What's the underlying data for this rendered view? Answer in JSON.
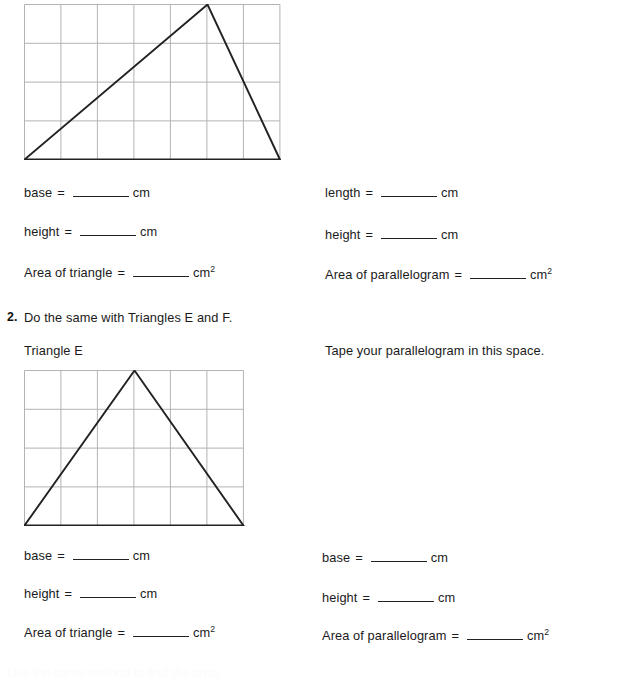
{
  "page": {
    "width": 617,
    "height": 674,
    "background": "#ffffff",
    "ink_color": "#1a1a1a",
    "grid_line_color": "#b3b3b3",
    "shape_line_color": "#222222"
  },
  "question1": {
    "figure": {
      "name": "Triangle with grid (Triangle C/D)",
      "grid_columns": 7,
      "grid_rows": 4,
      "triangle_vertices_cells": [
        [
          0,
          4
        ],
        [
          5,
          0
        ],
        [
          7,
          4
        ]
      ]
    },
    "left_column": {
      "rows": [
        {
          "label": "base",
          "equals": "=",
          "blank": "",
          "unit": "cm",
          "exponent": ""
        },
        {
          "label": "height",
          "equals": "=",
          "blank": "",
          "unit": "cm",
          "exponent": ""
        },
        {
          "label": "Area of triangle",
          "equals": "=",
          "blank": "",
          "unit": "cm",
          "exponent": "2"
        }
      ]
    },
    "right_column": {
      "rows": [
        {
          "label": "length",
          "equals": "=",
          "blank": "",
          "unit": "cm",
          "exponent": ""
        },
        {
          "label": "height",
          "equals": "=",
          "blank": "",
          "unit": "cm",
          "exponent": ""
        },
        {
          "label": "Area of parallelogram",
          "equals": "=",
          "blank": "",
          "unit": "cm",
          "exponent": "2"
        }
      ]
    }
  },
  "question2": {
    "number": "2.",
    "prompt": "Do the same with Triangles E and F.",
    "left_caption": "Triangle E",
    "right_caption": "Tape your parallelogram in this space.",
    "figure": {
      "name": "Isosceles triangle with grid (Triangle E)",
      "grid_columns": 6,
      "grid_rows": 4,
      "triangle_vertices_cells": [
        [
          0,
          4
        ],
        [
          3,
          0
        ],
        [
          6,
          4
        ]
      ]
    },
    "left_column": {
      "rows": [
        {
          "label": "base",
          "equals": "=",
          "blank": "",
          "unit": "cm",
          "exponent": ""
        },
        {
          "label": "height",
          "equals": "=",
          "blank": "",
          "unit": "cm",
          "exponent": ""
        },
        {
          "label": "Area of triangle",
          "equals": "=",
          "blank": "",
          "unit": "cm",
          "exponent": "2"
        }
      ]
    },
    "right_column": {
      "rows": [
        {
          "label": "base",
          "equals": "=",
          "blank": "",
          "unit": "cm",
          "exponent": ""
        },
        {
          "label": "height",
          "equals": "=",
          "blank": "",
          "unit": "cm",
          "exponent": ""
        },
        {
          "label": "Area of parallelogram",
          "equals": "=",
          "blank": "",
          "unit": "cm",
          "exponent": "2"
        }
      ]
    }
  },
  "footer": {
    "cut_off_text": "Use the same method to find the area."
  }
}
